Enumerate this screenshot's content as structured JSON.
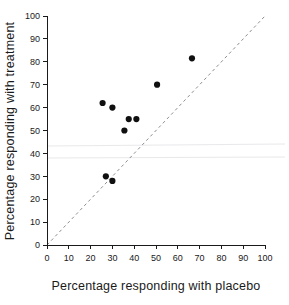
{
  "chart_data": {
    "type": "scatter",
    "title": "",
    "xlabel": "Percentage responding with placebo",
    "ylabel": "Percentage responding with treatment",
    "xlim": [
      0,
      100
    ],
    "ylim": [
      0,
      100
    ],
    "xticks": [
      0,
      10,
      20,
      30,
      40,
      50,
      60,
      70,
      80,
      90,
      100
    ],
    "yticks": [
      0,
      10,
      20,
      30,
      40,
      50,
      60,
      70,
      80,
      90,
      100
    ],
    "xtick_labels": [
      "0",
      "10",
      "20",
      "30",
      "40",
      "50",
      "60",
      "70",
      "80",
      "90",
      "100"
    ],
    "ytick_labels": [
      "0",
      "10",
      "20",
      "30",
      "40",
      "50",
      "60",
      "70",
      "80",
      "90",
      "100"
    ],
    "grid": false,
    "legend": null,
    "series": [
      {
        "name": "trials",
        "marker": "filled-circle",
        "color": "#101010",
        "points": [
          {
            "x": 25.5,
            "y": 62.0
          },
          {
            "x": 30.0,
            "y": 60.0
          },
          {
            "x": 27.0,
            "y": 30.0
          },
          {
            "x": 30.0,
            "y": 28.0
          },
          {
            "x": 35.5,
            "y": 50.0
          },
          {
            "x": 37.5,
            "y": 55.0
          },
          {
            "x": 41.0,
            "y": 55.0
          },
          {
            "x": 50.5,
            "y": 70.0
          },
          {
            "x": 66.5,
            "y": 81.5
          }
        ]
      }
    ],
    "reference_line": {
      "name": "line-of-equality",
      "type": "dashed",
      "color": "#8d8d93",
      "from": {
        "x": 0,
        "y": 0
      },
      "to": {
        "x": 100,
        "y": 100
      }
    }
  }
}
